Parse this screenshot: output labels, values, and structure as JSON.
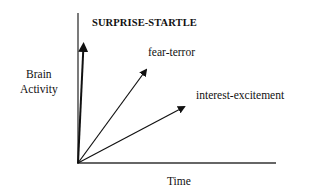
{
  "diagram": {
    "title": "SURPRISE-STARTLE",
    "y_axis_label": [
      "Brain",
      "Activity"
    ],
    "x_axis_label": "Time",
    "arrows": [
      {
        "name": "surprise-startle",
        "label": "SURPRISE-STARTLE",
        "from": [
          78,
          163
        ],
        "to": [
          84,
          41
        ]
      },
      {
        "name": "fear-terror",
        "label": "fear-terror",
        "from": [
          78,
          163
        ],
        "to": [
          148,
          67
        ]
      },
      {
        "name": "interest-excitement",
        "label": "interest-excitement",
        "from": [
          78,
          163
        ],
        "to": [
          187,
          106
        ]
      }
    ],
    "colors": {
      "line": "#111111",
      "axis": "#222222",
      "background": "#ffffff"
    }
  },
  "labels": {
    "fear": "fear-terror",
    "interest": "interest-excitement"
  }
}
